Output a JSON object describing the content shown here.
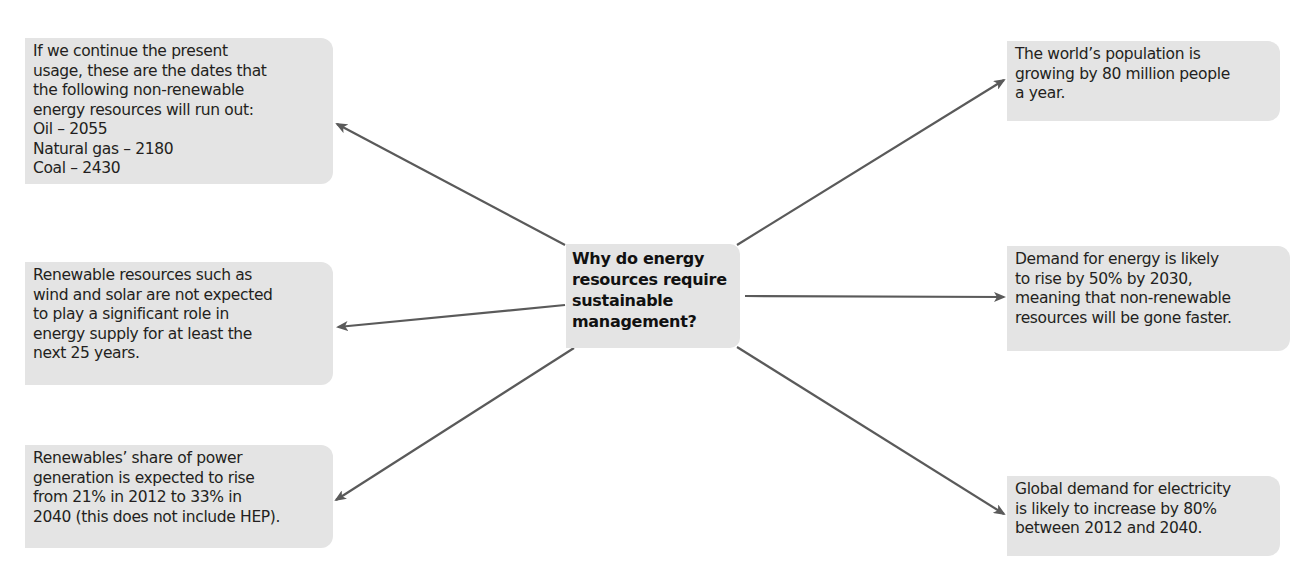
{
  "diagram": {
    "type": "spider-diagram",
    "center": {
      "text": "Why do energy\nresources require\nsustainable\nmanagement?"
    },
    "nodes": [
      {
        "id": "non-renewable-run-out",
        "position": "top-left",
        "text": "If we continue the present\nusage, these are the dates that\nthe following non-renewable\nenergy resources will run out:\nOil – 2055\nNatural gas – 2180\nCoal – 2430"
      },
      {
        "id": "renewables-not-significant",
        "position": "middle-left",
        "text": "Renewable resources such as\nwind and solar are not expected\nto play a significant role in\nenergy supply for at least the\nnext 25 years."
      },
      {
        "id": "renewables-share",
        "position": "bottom-left",
        "text": "Renewables’ share of power\ngeneration is expected to rise\nfrom 21% in 2012 to 33% in\n2040 (this does not include HEP)."
      },
      {
        "id": "population-growth",
        "position": "top-right",
        "text": "The world’s population is\ngrowing by 80 million people\na year."
      },
      {
        "id": "energy-demand",
        "position": "middle-right",
        "text": "Demand for energy is likely\nto rise by 50% by 2030,\nmeaning that non-renewable\nresources will be gone faster."
      },
      {
        "id": "electricity-demand",
        "position": "bottom-right",
        "text": "Global demand for electricity\nis likely to increase by 80%\nbetween 2012 and 2040."
      }
    ],
    "colors": {
      "box_fill": "#e4e4e4",
      "arrow": "#5a5a5a",
      "text": "#231f20"
    }
  }
}
